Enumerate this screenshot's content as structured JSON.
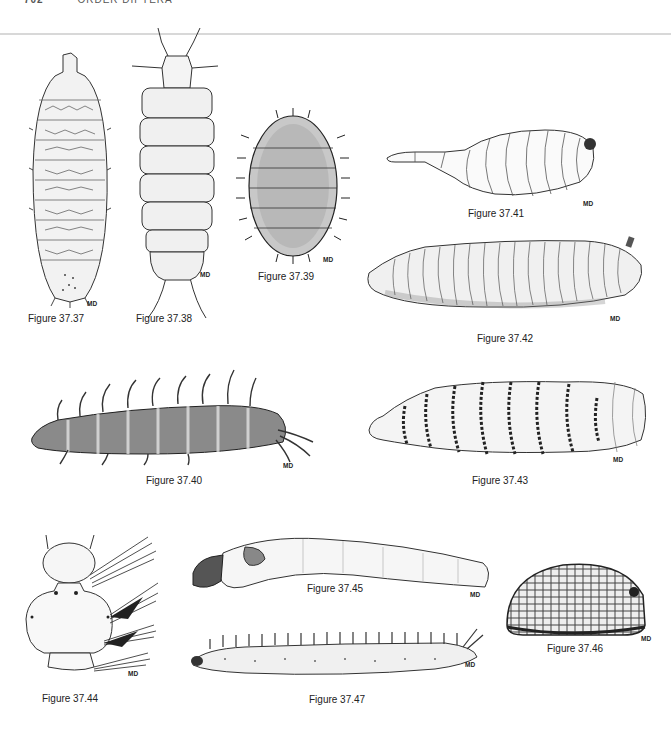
{
  "page": {
    "page_number": "702",
    "running_head": "ORDER DIPTERA",
    "artist_mark": "MD"
  },
  "figures": [
    {
      "id": "37.37",
      "caption": "Figure 37.37",
      "subject": "dorsal view flattened larva, segmented, spiny margins"
    },
    {
      "id": "37.38",
      "caption": "Figure 37.38",
      "subject": "dorsal view larva with long antennae and tail filaments"
    },
    {
      "id": "37.39",
      "caption": "Figure 37.39",
      "subject": "oval spiny larva, dorsal view"
    },
    {
      "id": "37.40",
      "caption": "Figure 37.40",
      "subject": "lateral view larva with long dorsal processes"
    },
    {
      "id": "37.41",
      "caption": "Figure 37.41",
      "subject": "smooth larva with tapered anterior"
    },
    {
      "id": "37.42",
      "caption": "Figure 37.42",
      "subject": "wrinkled maggot, lateral view"
    },
    {
      "id": "37.43",
      "caption": "Figure 37.43",
      "subject": "larva with bands of spines"
    },
    {
      "id": "37.44",
      "caption": "Figure 37.44",
      "subject": "head and thorax of larva with setal tufts"
    },
    {
      "id": "37.45",
      "caption": "Figure 37.45",
      "subject": "elongate cylindrical larva"
    },
    {
      "id": "37.46",
      "caption": "Figure 37.46",
      "subject": "domed puparium with reticulate surface"
    },
    {
      "id": "37.47",
      "caption": "Figure 37.47",
      "subject": "slender larva with dorsal setae"
    }
  ]
}
